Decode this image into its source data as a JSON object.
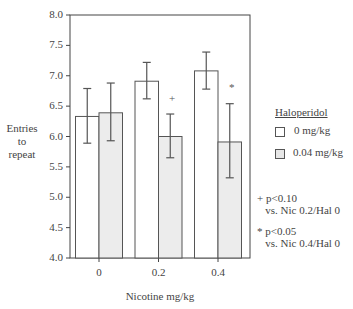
{
  "chart_data": {
    "type": "bar",
    "title": "",
    "xlabel": "Nicotine mg/kg",
    "ylabel": "Entries to repeat",
    "ylim": [
      4.0,
      8.0
    ],
    "yticks": [
      "4.0",
      "4.5",
      "5.0",
      "5.5",
      "6.0",
      "6.5",
      "7.0",
      "7.5",
      "8.0"
    ],
    "categories": [
      "0",
      "0.2",
      "0.4"
    ],
    "legend_title": "Haloperidol",
    "legend_position": "right",
    "grid": false,
    "series": [
      {
        "name": "0 mg/kg",
        "color": "#ffffff",
        "values": [
          6.33,
          6.91,
          7.08
        ],
        "error_upper": [
          6.79,
          7.22,
          7.39
        ],
        "error_lower": [
          5.89,
          6.62,
          6.78
        ]
      },
      {
        "name": "0.04 mg/kg",
        "color": "#ececec",
        "values": [
          6.39,
          6.0,
          5.91
        ],
        "error_upper": [
          6.88,
          6.37,
          6.54
        ],
        "error_lower": [
          5.93,
          5.65,
          5.32
        ]
      }
    ],
    "annotations": [
      {
        "symbol": "+",
        "category": "0.2",
        "series": "0.04 mg/kg",
        "text": "p<0.10",
        "detail": "vs. Nic 0.2/Hal 0"
      },
      {
        "symbol": "*",
        "category": "0.4",
        "series": "0.04 mg/kg",
        "text": "p<0.05",
        "detail": "vs. Nic 0.4/Hal 0"
      }
    ]
  },
  "labels": {
    "ylabel_lines": [
      "Entries",
      "to",
      "repeat"
    ],
    "xlabel": "Nicotine mg/kg",
    "legend_title": "Haloperidol",
    "legend_items": [
      "0 mg/kg",
      "0.04 mg/kg"
    ],
    "note_plus": "+ p<0.10\n   vs. Nic 0.2/Hal 0",
    "note_star": "* p<0.05\n   vs. Nic 0.4/Hal 0",
    "marker_plus": "+",
    "marker_star": "*"
  }
}
